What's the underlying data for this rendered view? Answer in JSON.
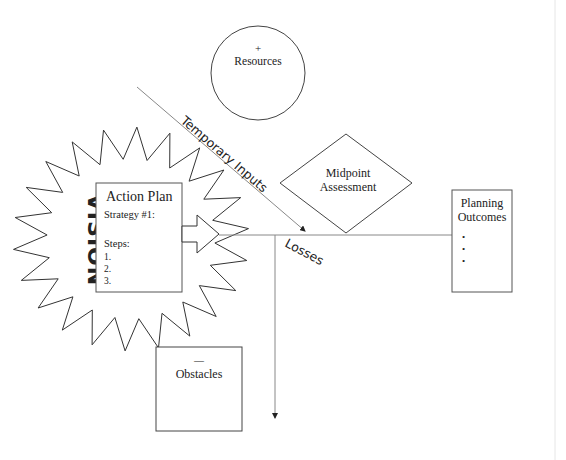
{
  "diagram": {
    "type": "planning-flow-diagram",
    "colors": {
      "stroke": "#333333",
      "line": "#888888",
      "text": "#222222",
      "background": "#ffffff",
      "edge_line": "#e6e6e6"
    },
    "vision": {
      "label": "VISION",
      "shape": "starburst"
    },
    "action_plan": {
      "title": "Action Plan",
      "strategy": "Strategy #1:",
      "steps_label": "Steps:",
      "steps": [
        "1.",
        "2.",
        "3."
      ]
    },
    "resources": {
      "sign": "+",
      "label": "Resources",
      "shape": "circle"
    },
    "temporary_inputs": {
      "label": "Temporary Inputs"
    },
    "midpoint": {
      "line1": "Midpoint",
      "line2": "Assessment",
      "shape": "diamond"
    },
    "planning_outcomes": {
      "line1": "Planning",
      "line2": "Outcomes",
      "bullets": [
        "•",
        "•",
        "•"
      ]
    },
    "losses": {
      "label": "Losses"
    },
    "obstacles": {
      "sign": "—",
      "label": "Obstacles"
    }
  }
}
